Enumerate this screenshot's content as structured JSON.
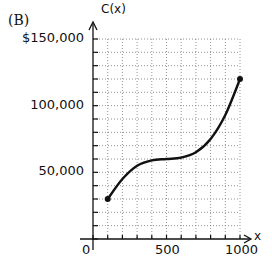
{
  "panel_label": "(B)",
  "chart_data": {
    "type": "line",
    "title": "",
    "xlabel": "x",
    "ylabel": "C(x)",
    "xlim": [
      0,
      1000
    ],
    "ylim": [
      0,
      150000
    ],
    "x_ticks": [
      0,
      100,
      200,
      300,
      400,
      500,
      600,
      700,
      800,
      900,
      1000
    ],
    "x_tick_labels": {
      "0": "0",
      "500": "500",
      "1000": "1000"
    },
    "y_ticks": [
      0,
      10000,
      20000,
      30000,
      40000,
      50000,
      60000,
      70000,
      80000,
      90000,
      100000,
      110000,
      120000,
      130000,
      140000,
      150000
    ],
    "y_tick_labels": {
      "50000": "50,000",
      "100000": "100,000",
      "150000": "$150,000"
    },
    "grid": true,
    "grid_style": "dotted",
    "series": [
      {
        "name": "C(x)",
        "x": [
          100,
          200,
          300,
          400,
          500,
          600,
          700,
          800,
          900,
          1000
        ],
        "values": [
          30000,
          45000,
          55000,
          59000,
          60000,
          61000,
          65000,
          75000,
          93000,
          120000
        ],
        "endpoints_marked": true
      }
    ]
  },
  "labels": {
    "ylabel": "C(x)",
    "xlabel": "x",
    "y150": "$150,000",
    "y100": "100,000",
    "y50": "50,000",
    "x0": "0",
    "x500": "500",
    "x1000": "1000"
  }
}
